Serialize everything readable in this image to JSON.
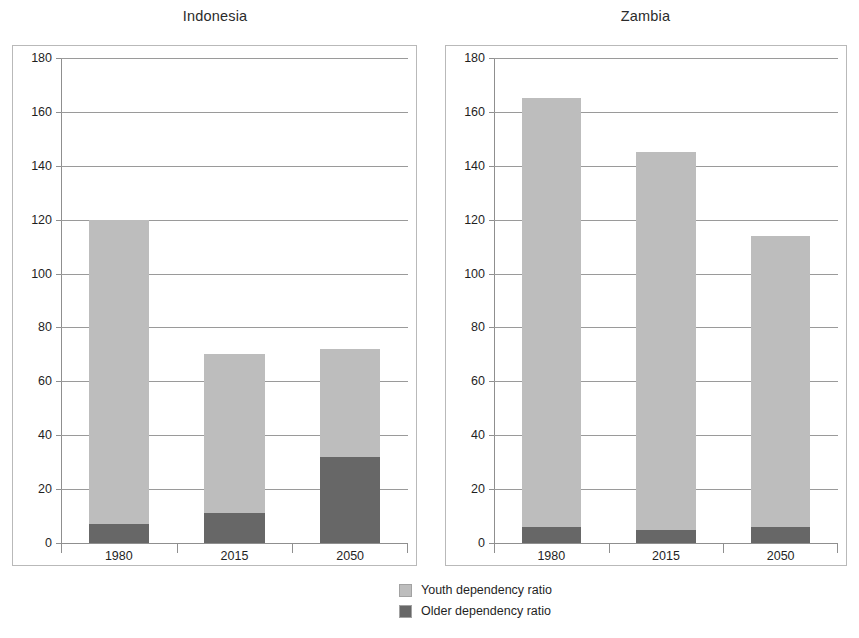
{
  "legend": {
    "position": "bottom-center",
    "entries": [
      {
        "label": "Youth dependency ratio",
        "color": "#bdbdbd",
        "key": "youth"
      },
      {
        "label": "Older dependency ratio",
        "color": "#676767",
        "key": "older"
      }
    ]
  },
  "chart_data": [
    {
      "type": "bar",
      "stacked": true,
      "title": "Indonesia",
      "xlabel": "",
      "ylabel": "",
      "ylim": [
        0,
        180
      ],
      "yticks": [
        0,
        20,
        40,
        60,
        80,
        100,
        120,
        140,
        160,
        180
      ],
      "grid": true,
      "categories": [
        "1980",
        "2015",
        "2050"
      ],
      "series": [
        {
          "name": "Older dependency ratio",
          "color": "#676767",
          "values": [
            7,
            11,
            32
          ]
        },
        {
          "name": "Youth dependency ratio",
          "color": "#bdbdbd",
          "values": [
            113,
            59,
            40
          ]
        }
      ],
      "totals": [
        120,
        70,
        72
      ]
    },
    {
      "type": "bar",
      "stacked": true,
      "title": "Zambia",
      "xlabel": "",
      "ylabel": "",
      "ylim": [
        0,
        180
      ],
      "yticks": [
        0,
        20,
        40,
        60,
        80,
        100,
        120,
        140,
        160,
        180
      ],
      "grid": true,
      "categories": [
        "1980",
        "2015",
        "2050"
      ],
      "series": [
        {
          "name": "Older dependency ratio",
          "color": "#676767",
          "values": [
            6,
            5,
            6
          ]
        },
        {
          "name": "Youth dependency ratio",
          "color": "#bdbdbd",
          "values": [
            159,
            140,
            108
          ]
        }
      ],
      "totals": [
        165,
        145,
        114
      ]
    }
  ]
}
